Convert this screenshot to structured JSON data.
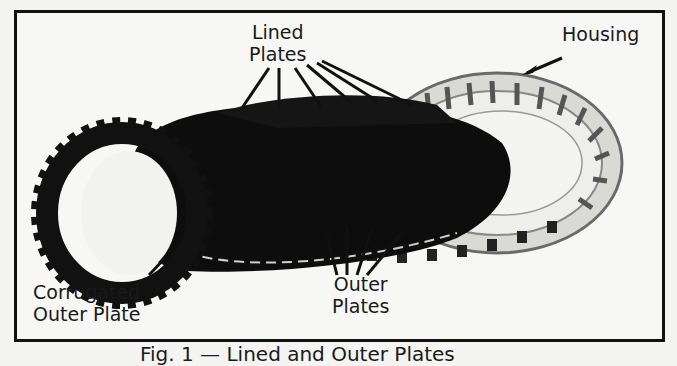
{
  "figure": {
    "labels": {
      "lined_plates": [
        "Lined",
        "Plates"
      ],
      "housing": "Housing",
      "corrugated_outer_plate": [
        "Corrugated",
        "Outer Plate"
      ],
      "outer_plates": [
        "Outer",
        "Plates"
      ]
    },
    "caption": "Fig. 1 — Lined and Outer Plates"
  }
}
